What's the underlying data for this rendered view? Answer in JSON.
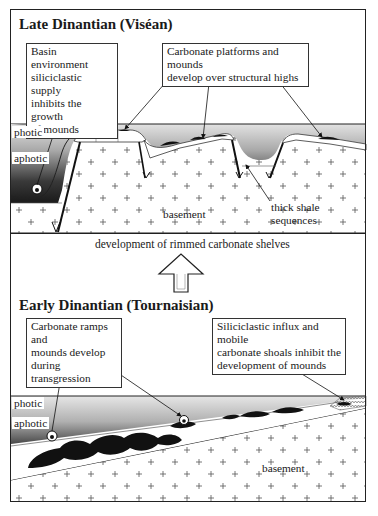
{
  "top_panel": {
    "title": "Late Dinantian (Viséan)",
    "callouts": {
      "basin": [
        "Basin environment",
        "siliciclastic supply",
        "inhibits the growth",
        "of mounds"
      ],
      "platforms": [
        "Carbonate platforms and mounds",
        "develop over structural highs"
      ]
    },
    "labels": {
      "photic": "photic",
      "aphotic": "aphotic",
      "basement": "basement",
      "shale": [
        "thick shale",
        "sequences"
      ]
    }
  },
  "transition": {
    "caption": "development of rimmed carbonate shelves",
    "arrow": "up-arrow-icon"
  },
  "bottom_panel": {
    "title": "Early Dinantian (Tournaisian)",
    "callouts": {
      "ramps": [
        "Carbonate ramps and",
        "mounds develop",
        "during transgression"
      ],
      "influx": [
        "Siliciclastic influx and mobile",
        "carbonate shoals inhibit the",
        "development of mounds"
      ]
    },
    "labels": {
      "photic": "photic",
      "aphotic": "aphotic",
      "basement": "basement"
    }
  },
  "colors": {
    "line": "#1a1a1a",
    "water_light": "#e4e4e4",
    "water_dark": "#2a2a2a",
    "mound": "#111111",
    "basement": "#ffffff"
  }
}
